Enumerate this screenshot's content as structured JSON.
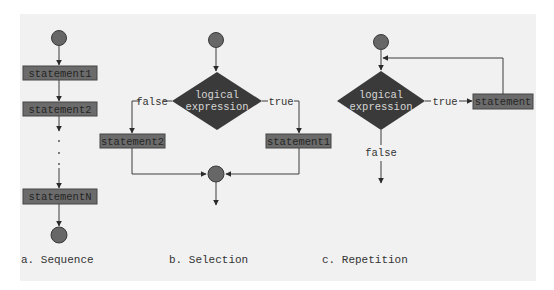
{
  "colors": {
    "panel_bg": "#f1f1f1",
    "box_fill": "#6b6b6b",
    "box_border": "#454545",
    "diamond_fill": "#3a3a3a",
    "circle_fill": "#676767",
    "line": "#3c3c3c"
  },
  "sequence": {
    "caption": "a. Sequence",
    "statements": [
      "statement1",
      "statement2",
      "statementN"
    ],
    "ellipsis": "."
  },
  "selection": {
    "caption": "b. Selection",
    "condition_line1": "logical",
    "condition_line2": "expression",
    "false_label": "false",
    "true_label": "true",
    "false_statement": "statement2",
    "true_statement": "statement1"
  },
  "repetition": {
    "caption": "c. Repetition",
    "condition_line1": "logical",
    "condition_line2": "expression",
    "true_label": "true",
    "false_label": "false",
    "statement": "statement"
  }
}
